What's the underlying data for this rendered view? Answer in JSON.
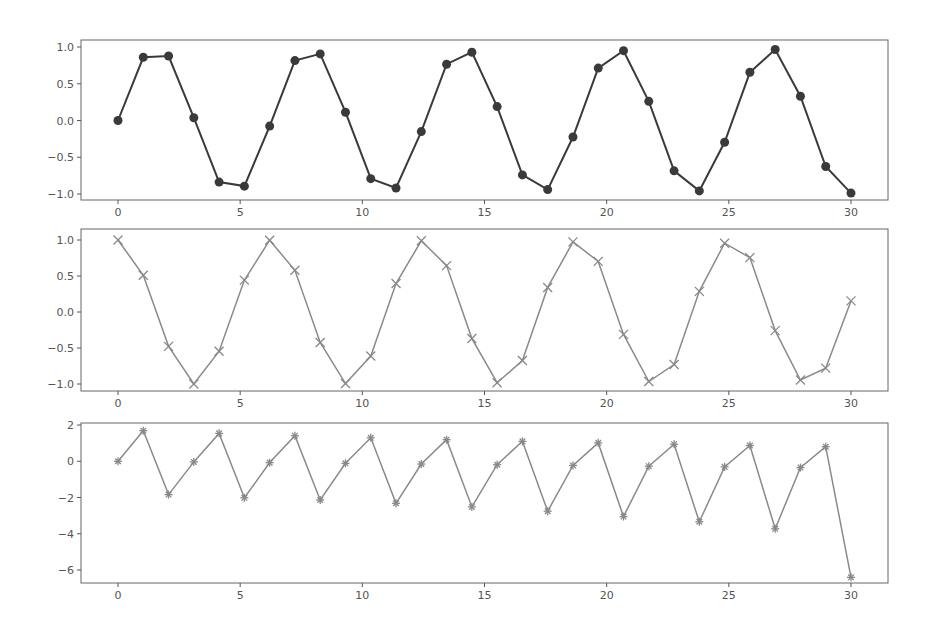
{
  "chart_data": [
    {
      "type": "line",
      "title": "",
      "xlabel": "",
      "ylabel": "",
      "marker": "o",
      "line_color": "#3a3a3a",
      "grid": false,
      "xlim": [
        -1.5,
        31.5
      ],
      "ylim": [
        -1.1,
        1.1
      ],
      "xticks": [
        0,
        5,
        10,
        15,
        20,
        25,
        30
      ],
      "yticks": [
        1.0,
        0.5,
        0.0,
        -0.5,
        -1.0
      ],
      "ytick_labels": [
        "1.0",
        "0.5",
        "0.0",
        "−0.5",
        "−1.0"
      ],
      "x": [
        0,
        1.034,
        2.069,
        3.103,
        4.138,
        5.172,
        6.207,
        7.241,
        8.276,
        9.31,
        10.345,
        11.379,
        12.414,
        13.448,
        14.483,
        15.517,
        16.552,
        17.586,
        18.621,
        19.655,
        20.69,
        21.724,
        22.759,
        23.793,
        24.828,
        25.862,
        26.897,
        27.931,
        28.966,
        30
      ],
      "values": [
        0,
        0.86,
        0.878,
        0.038,
        -0.838,
        -0.893,
        -0.076,
        0.815,
        0.906,
        0.113,
        -0.791,
        -0.918,
        -0.151,
        0.766,
        0.929,
        0.189,
        -0.74,
        -0.94,
        -0.225,
        0.713,
        0.95,
        0.261,
        -0.685,
        -0.958,
        -0.296,
        0.656,
        0.966,
        0.33,
        -0.626,
        -0.988
      ]
    },
    {
      "type": "line",
      "title": "",
      "xlabel": "",
      "ylabel": "",
      "marker": "x",
      "line_color": "#8a8a8a",
      "grid": false,
      "xlim": [
        -1.5,
        31.5
      ],
      "ylim": [
        -1.1,
        1.1
      ],
      "xticks": [
        0,
        5,
        10,
        15,
        20,
        25,
        30
      ],
      "yticks": [
        1.0,
        0.5,
        0.0,
        -0.5,
        -1.0
      ],
      "ytick_labels": [
        "1.0",
        "0.5",
        "0.0",
        "−0.5",
        "−1.0"
      ],
      "x": [
        0,
        1.034,
        2.069,
        3.103,
        4.138,
        5.172,
        6.207,
        7.241,
        8.276,
        9.31,
        10.345,
        11.379,
        12.414,
        13.448,
        14.483,
        15.517,
        16.552,
        17.586,
        18.621,
        19.655,
        20.69,
        21.724,
        22.759,
        23.793,
        24.828,
        25.862,
        26.897,
        27.931,
        28.966,
        30
      ],
      "values": [
        1,
        0.51,
        -0.477,
        -0.999,
        -0.545,
        0.443,
        0.997,
        0.579,
        -0.424,
        -0.994,
        -0.612,
        0.396,
        0.989,
        0.644,
        -0.369,
        -0.982,
        -0.674,
        0.341,
        0.974,
        0.703,
        -0.311,
        -0.965,
        -0.729,
        0.287,
        0.955,
        0.755,
        -0.259,
        -0.944,
        -0.78,
        0.154
      ]
    },
    {
      "type": "line",
      "title": "",
      "xlabel": "",
      "ylabel": "",
      "marker": "*",
      "line_color": "#8a8a8a",
      "grid": false,
      "xlim": [
        -1.5,
        31.5
      ],
      "ylim": [
        -6.8,
        2.0
      ],
      "xticks": [
        0,
        5,
        10,
        15,
        20,
        25,
        30
      ],
      "yticks": [
        2,
        0,
        -2,
        -4,
        -6
      ],
      "ytick_labels": [
        "2",
        "0",
        "−2",
        "−4",
        "−6"
      ],
      "x": [
        0,
        1.034,
        2.069,
        3.103,
        4.138,
        5.172,
        6.207,
        7.241,
        8.276,
        9.31,
        10.345,
        11.379,
        12.414,
        13.448,
        14.483,
        15.517,
        16.552,
        17.586,
        18.621,
        19.655,
        20.69,
        21.724,
        22.759,
        23.793,
        24.828,
        25.862,
        26.897,
        27.931,
        28.966,
        30
      ],
      "values": [
        0,
        1.686,
        -1.84,
        -0.038,
        1.538,
        -2.017,
        -0.076,
        1.409,
        -2.137,
        -0.114,
        1.293,
        -2.318,
        -0.153,
        1.19,
        -2.518,
        -0.192,
        1.098,
        -2.755,
        -0.231,
        1.015,
        -3.053,
        -0.27,
        0.94,
        -3.338,
        -0.31,
        0.869,
        -3.727,
        -0.35,
        0.803,
        -6.405
      ]
    }
  ],
  "layout": {
    "axes": [
      {
        "left": 81,
        "top": 40,
        "right": 888,
        "bottom": 200,
        "y_top_val": 1.0,
        "y_top_px": 47,
        "y_bot_val": -1.0,
        "y_bot_px": 194
      },
      {
        "left": 81,
        "top": 229,
        "right": 888,
        "bottom": 391,
        "y_top_val": 1.0,
        "y_top_px": 240,
        "y_bot_val": -1.0,
        "y_bot_px": 384
      },
      {
        "left": 81,
        "top": 423,
        "right": 888,
        "bottom": 583,
        "y_top_val": 2,
        "y_top_px": 425,
        "y_bot_val": -6,
        "y_bot_px": 570
      }
    ],
    "x0_px": 118,
    "x30_px": 851
  }
}
